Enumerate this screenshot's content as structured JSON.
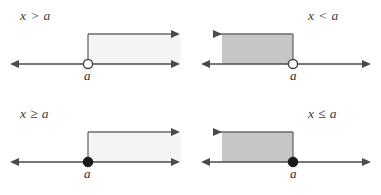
{
  "figure": {
    "width": 381,
    "height": 195,
    "background_color": "#ffffff",
    "line_color": "#4a4a4a",
    "dot_color": "#1a1a1a",
    "open_circle_fill": "#ffffff",
    "label_color": "#3a3a3a"
  },
  "panels": [
    {
      "id": "x-greater-than-a",
      "position": "top-left",
      "inequality_label": "x > a",
      "point_label": "a",
      "endpoint_type": "open",
      "direction": "right",
      "shade_color": "#f4f4f4",
      "shade_border_color": "#6a6a6a",
      "included_endpoint": false,
      "description": "Open circle at a, region shaded to the right"
    },
    {
      "id": "x-less-than-a",
      "position": "top-right",
      "inequality_label": "x < a",
      "point_label": "a",
      "endpoint_type": "open",
      "direction": "left",
      "shade_color": "#c6c6c6",
      "shade_border_color": "#6a6a6a",
      "included_endpoint": false,
      "description": "Open circle at a, region shaded to the left"
    },
    {
      "id": "x-greater-than-or-equal-a",
      "position": "bottom-left",
      "inequality_label": "x ≥ a",
      "point_label": "a",
      "endpoint_type": "closed",
      "direction": "right",
      "shade_color": "#f4f4f4",
      "shade_border_color": "#6a6a6a",
      "included_endpoint": true,
      "description": "Filled dot at a, region shaded to the right"
    },
    {
      "id": "x-less-than-or-equal-a",
      "position": "bottom-right",
      "inequality_label": "x ≤ a",
      "point_label": "a",
      "endpoint_type": "closed",
      "direction": "left",
      "shade_color": "#c6c6c6",
      "shade_border_color": "#6a6a6a",
      "included_endpoint": true,
      "description": "Filled dot at a, region shaded to the left"
    }
  ]
}
